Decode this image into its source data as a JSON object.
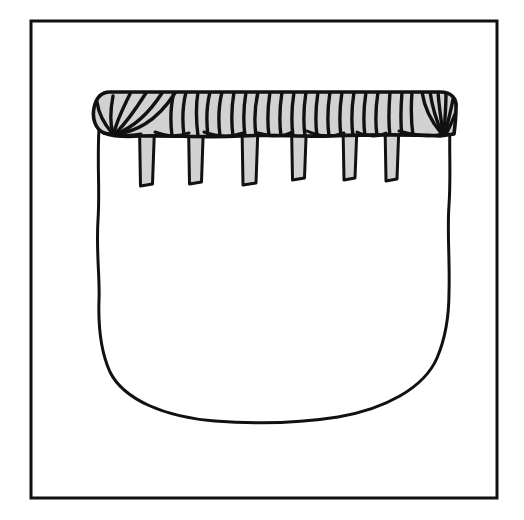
{
  "image": {
    "title": "Line drawing of a bag with wrapped striped rim and hanging tabs",
    "width": 524,
    "height": 520,
    "background_color": "#ffffff",
    "ink_color": "#111111",
    "fill_gray": "#d2d2d2",
    "style": "black ink line drawing, hand-drawn",
    "caption": ""
  },
  "frame": {
    "name": "rectangular border frame",
    "x": 31,
    "y": 21,
    "width": 466,
    "height": 477,
    "stroke_width": 3,
    "stroke_color": "#111111",
    "fill": "none"
  },
  "bag": {
    "name": "bag body",
    "description": "U-shaped pouch with near-vertical slightly wavy sides and a broad flat-rounded bottom",
    "left_edge_x": 99,
    "right_edge_x": 450,
    "top_y": 130,
    "bottom_y": 410,
    "fill": "#ffffff",
    "stroke_color": "#111111",
    "stroke_width": 3
  },
  "rim_band": {
    "name": "wrapped striped rim band",
    "x": 93,
    "y": 91,
    "width": 363,
    "height": 46,
    "fill": "#d2d2d2",
    "stroke_color": "#111111",
    "stroke_width": 3,
    "stripe_count": 34,
    "stripe_orientation": "vertical, slightly curved, wrapping",
    "end_fan_left": "stripes radiate and converge at lower-left point",
    "end_fan_right": "stripes radiate and converge at lower-right point"
  },
  "tabs": {
    "name": "hanging tabs",
    "count": 6,
    "fill": "#d2d2d2",
    "stroke_color": "#111111",
    "stroke_width": 3,
    "items": [
      {
        "label": "tab-1",
        "center_x": 147,
        "top_y": 128,
        "bottom_y": 186,
        "width": 15
      },
      {
        "label": "tab-2",
        "center_x": 196,
        "top_y": 124,
        "bottom_y": 184,
        "width": 15
      },
      {
        "label": "tab-3",
        "center_x": 250,
        "top_y": 126,
        "bottom_y": 185,
        "width": 16
      },
      {
        "label": "tab-4",
        "center_x": 299,
        "top_y": 124,
        "bottom_y": 180,
        "width": 15
      },
      {
        "label": "tab-5",
        "center_x": 350,
        "top_y": 126,
        "bottom_y": 180,
        "width": 14
      },
      {
        "label": "tab-6",
        "center_x": 392,
        "top_y": 124,
        "bottom_y": 181,
        "width": 14
      }
    ]
  }
}
